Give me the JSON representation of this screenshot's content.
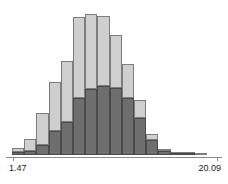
{
  "chart_data": {
    "type": "bar",
    "title": "",
    "subtitle": "",
    "xlabel": "",
    "ylabel": "",
    "grid": false,
    "legend_position": "none",
    "stacked": true,
    "axis": {
      "x_min_label": "1.47",
      "x_max_label": "20.09",
      "x_min": 1.47,
      "x_max": 20.09,
      "ticks": [
        "1.47",
        "20.09"
      ]
    },
    "ylim": [
      0,
      100
    ],
    "bin_count": 16,
    "categories": [
      "1.47",
      "2.63",
      "3.80",
      "4.96",
      "6.13",
      "7.29",
      "8.46",
      "9.62",
      "10.79",
      "11.95",
      "13.12",
      "14.28",
      "15.45",
      "16.61",
      "17.78",
      "18.94"
    ],
    "series": [
      {
        "name": "dark-series",
        "color": "#6e6e6e",
        "values": [
          2,
          3,
          7,
          16,
          22,
          38,
          44,
          46,
          45,
          38,
          25,
          10,
          3,
          1,
          1,
          0
        ]
      },
      {
        "name": "light-series",
        "color": "#cfcfcf",
        "values": [
          3,
          8,
          21,
          33,
          41,
          54,
          50,
          47,
          35,
          23,
          12,
          4,
          1,
          1,
          1,
          1
        ]
      }
    ],
    "totals": [
      5,
      11,
      28,
      49,
      63,
      92,
      94,
      93,
      80,
      61,
      37,
      14,
      4,
      2,
      2,
      1
    ]
  },
  "colors": {
    "light_fill": "#cfcfcf",
    "dark_fill": "#6e6e6e",
    "bar_stroke": "#7d7d7d",
    "dark_stroke": "#4a4a4a",
    "axis": "#8a8a8a",
    "text": "#1a1a1a",
    "background": "#ffffff"
  }
}
